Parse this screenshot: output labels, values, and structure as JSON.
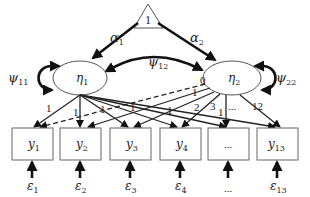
{
  "diagram": {
    "type": "latent growth curve model (SEM path diagram)",
    "constant": {
      "label": "1",
      "shape": "triangle"
    },
    "latent": [
      {
        "id": "eta1",
        "label": "η",
        "sub": "1",
        "variance": {
          "label": "ψ",
          "sub": "11"
        }
      },
      {
        "id": "eta2",
        "label": "η",
        "sub": "2",
        "variance": {
          "label": "ψ",
          "sub": "22"
        }
      }
    ],
    "means": [
      {
        "label": "α",
        "sub": "1"
      },
      {
        "label": "α",
        "sub": "2"
      }
    ],
    "covariance": {
      "label": "ψ",
      "sub": "12"
    },
    "observed": [
      {
        "label": "y",
        "sub": "1"
      },
      {
        "label": "y",
        "sub": "2"
      },
      {
        "label": "y",
        "sub": "3"
      },
      {
        "label": "y",
        "sub": "4"
      },
      {
        "label": "...",
        "sub": ""
      },
      {
        "label": "y",
        "sub": "13"
      }
    ],
    "errors": [
      {
        "label": "ε",
        "sub": "1"
      },
      {
        "label": "ε",
        "sub": "2"
      },
      {
        "label": "ε",
        "sub": "3"
      },
      {
        "label": "ε",
        "sub": "4"
      },
      {
        "label": "...",
        "sub": ""
      },
      {
        "label": "ε",
        "sub": "13"
      }
    ],
    "intercept_loadings": [
      "1",
      "1",
      "1",
      "1",
      "1",
      "1"
    ],
    "slope_loadings": [
      "0",
      "1",
      "2",
      "3",
      "...",
      "12"
    ]
  }
}
